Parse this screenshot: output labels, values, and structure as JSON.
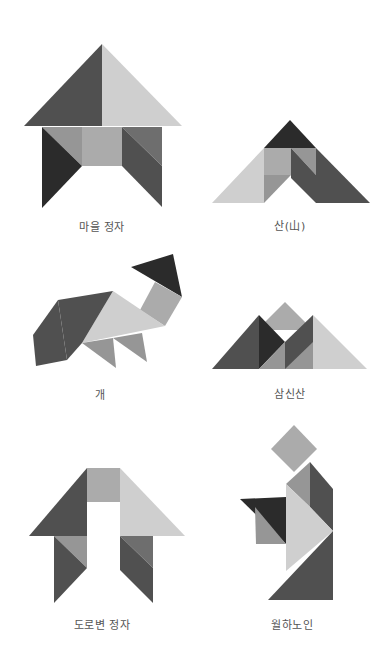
{
  "colors": {
    "darkest": "#2b2b2b",
    "dark": "#505050",
    "mid_dark": "#6e6e6e",
    "mid": "#969696",
    "mid_light": "#ababab",
    "light": "#cfcfcf",
    "background": "#ffffff"
  },
  "figures": [
    {
      "id": "village-pavilion",
      "label": "마을 정자"
    },
    {
      "id": "mountain",
      "label": "산(山)"
    },
    {
      "id": "dog",
      "label": "개"
    },
    {
      "id": "three-mountains",
      "label": "삼신산"
    },
    {
      "id": "roadside-pavilion",
      "label": "도로변 정자"
    },
    {
      "id": "matchmaker-old-man",
      "label": "월하노인"
    }
  ]
}
